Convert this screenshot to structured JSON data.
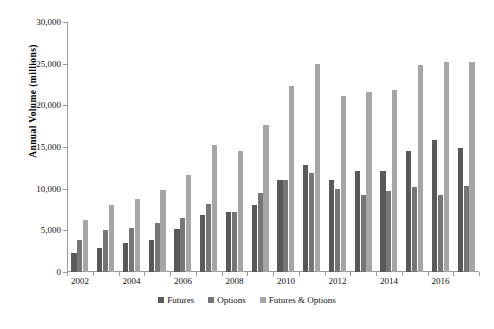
{
  "chart_data": {
    "type": "bar",
    "title": "",
    "xlabel": "",
    "ylabel": "Annual Volume (millions)",
    "ylim": [
      0,
      30000
    ],
    "ytick_values": [
      0,
      5000,
      10000,
      15000,
      20000,
      25000,
      30000
    ],
    "ytick_labels": [
      "0",
      "5,000",
      "10,000",
      "15,000",
      "20,000",
      "25,000",
      "30,000"
    ],
    "categories": [
      "2002",
      "2003",
      "2004",
      "2005",
      "2006",
      "2007",
      "2008",
      "2009",
      "2010",
      "2011",
      "2012",
      "2013",
      "2014",
      "2015",
      "2016",
      "2017"
    ],
    "xtick_labels": [
      "2002",
      "2004",
      "2006",
      "2008",
      "2010",
      "2012",
      "2014",
      "2016"
    ],
    "grid": false,
    "legend_position": "bottom",
    "series": [
      {
        "name": "Futures",
        "color": "#595959",
        "values": [
          2300,
          2900,
          3500,
          3900,
          5200,
          6900,
          7200,
          8100,
          11100,
          12900,
          11100,
          12100,
          12100,
          14500,
          15900,
          14900
        ]
      },
      {
        "name": "Options",
        "color": "#767676",
        "values": [
          3900,
          5100,
          5300,
          5900,
          6500,
          8200,
          7200,
          9500,
          11000,
          11900,
          10000,
          9300,
          9700,
          10200,
          9300,
          10300
        ]
      },
      {
        "name": "Futures & Options",
        "color": "#a6a6a6",
        "values": [
          6200,
          8100,
          8800,
          9800,
          11700,
          15200,
          14500,
          17700,
          22300,
          25000,
          21100,
          21600,
          21900,
          24800,
          25200,
          25200
        ]
      }
    ]
  },
  "axis": {
    "y_title": "Annual Volume (millions)"
  },
  "legend": {
    "items": [
      {
        "label": "Futures",
        "color": "#595959"
      },
      {
        "label": "Options",
        "color": "#767676"
      },
      {
        "label": "Futures & Options",
        "color": "#a6a6a6"
      }
    ]
  }
}
